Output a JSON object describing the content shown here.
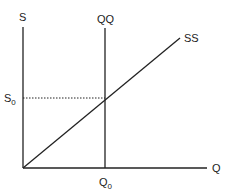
{
  "diagram": {
    "y_axis_label": "S",
    "x_axis_label": "Q",
    "vertical_curve_label": "QQ",
    "diagonal_curve_label": "SS",
    "y_marker": {
      "base": "S",
      "sub": "0"
    },
    "x_marker": {
      "base": "Q",
      "sub": "0"
    }
  },
  "colors": {
    "line": "#222222",
    "background": "#ffffff"
  }
}
